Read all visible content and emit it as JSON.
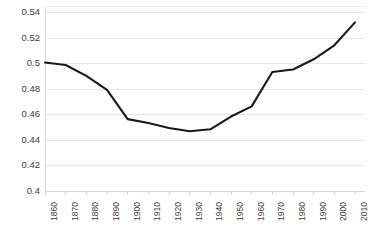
{
  "chart_data": {
    "type": "line",
    "title": "",
    "subtitle": "",
    "xlabel": "",
    "ylabel": "",
    "grid": true,
    "grid_axis": "y",
    "legend": false,
    "legend_position": "none",
    "line_color": "#1a1a1a",
    "grid_color": "#e6e6e6",
    "axis_color": "#d9d9d9",
    "tick_label_color": "#3d3d3d",
    "background": "#ffffff",
    "xlim": [
      1860,
      2010
    ],
    "ylim": [
      0.4,
      0.545
    ],
    "ytick_values": [
      0.4,
      0.42,
      0.44,
      0.46,
      0.48,
      0.5,
      0.52,
      0.54
    ],
    "ytick_labels": [
      "0.4",
      "0.42",
      "0.44",
      "0.46",
      "0.48",
      "0.5",
      "0.52",
      "0.54"
    ],
    "categories": [
      "1860",
      "1870",
      "1880",
      "1890",
      "1900",
      "1910",
      "1920",
      "1930",
      "1940",
      "1950",
      "1960",
      "1970",
      "1980",
      "1990",
      "2000",
      "2010"
    ],
    "x": [
      1860,
      1870,
      1880,
      1890,
      1900,
      1910,
      1920,
      1930,
      1940,
      1950,
      1960,
      1970,
      1980,
      1990,
      2000,
      2010
    ],
    "values": [
      0.501,
      0.499,
      0.4905,
      0.4795,
      0.4565,
      0.4535,
      0.4495,
      0.447,
      0.4485,
      0.4585,
      0.4665,
      0.4935,
      0.4955,
      0.5035,
      0.5145,
      0.5325
    ],
    "series": [
      {
        "name": "series-1",
        "values": [
          0.501,
          0.499,
          0.4905,
          0.4795,
          0.4565,
          0.4535,
          0.4495,
          0.447,
          0.4485,
          0.4585,
          0.4665,
          0.4935,
          0.4955,
          0.5035,
          0.5145,
          0.5325
        ]
      }
    ]
  }
}
